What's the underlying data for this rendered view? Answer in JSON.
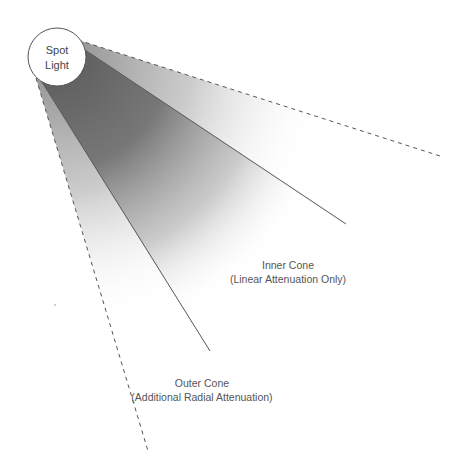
{
  "diagram": {
    "light": {
      "label_line1": "Spot",
      "label_line2": "Light",
      "center": [
        57,
        57
      ],
      "radius": 29
    },
    "inner_cone": {
      "label_line1": "Inner Cone",
      "label_line2": "(Linear Attenuation Only)",
      "line_style": "solid"
    },
    "outer_cone": {
      "label_line1": "Outer Cone",
      "label_line2": "(Additional Radial Attenuation)",
      "line_style": "dashed"
    },
    "colors": {
      "inner_fill": "#6e6e6e",
      "outer_fill": "#9a9a9a",
      "line": "#555555",
      "background": "#ffffff"
    }
  }
}
